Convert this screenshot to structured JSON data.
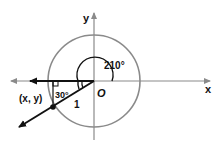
{
  "diagram": {
    "labels": {
      "y_axis": "y",
      "x_axis": "x",
      "origin": "O",
      "angle": "210°",
      "reference_angle": "30°",
      "point": "(x, y)",
      "radius": "1"
    },
    "colors": {
      "axis": "#8a8a8a",
      "circle": "#8a8a8a",
      "ray": "#111111",
      "text": "#111111"
    },
    "geometry": {
      "center": [
        94,
        81
      ],
      "radius": 46,
      "angle_degrees": 210
    }
  }
}
